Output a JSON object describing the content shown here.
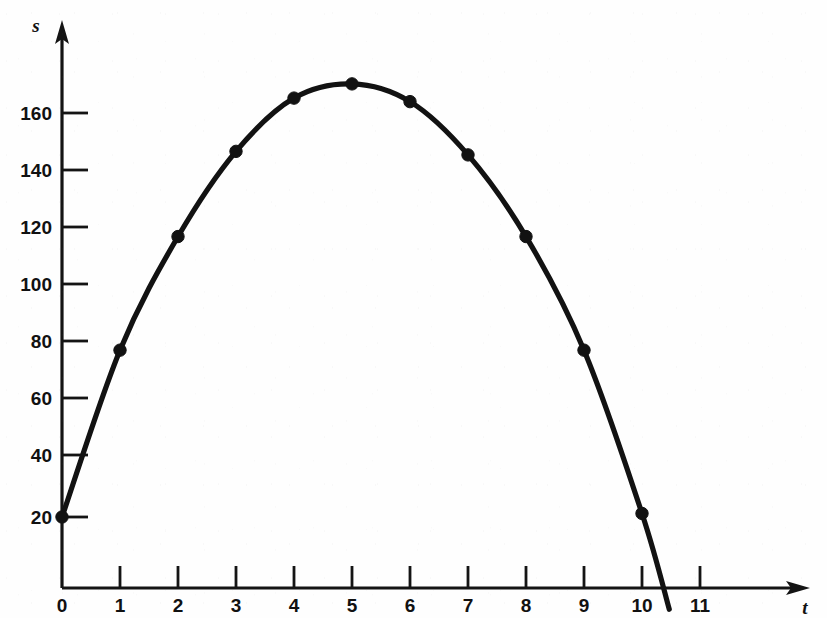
{
  "chart_data": {
    "type": "line",
    "title": "",
    "subtitle": "",
    "xlabel": "t",
    "ylabel": "s",
    "xlim": [
      0,
      11.6
    ],
    "ylim": [
      0,
      178
    ],
    "grid": false,
    "legend": null,
    "legend_position": "none",
    "x_ticks": [
      0,
      1,
      2,
      3,
      4,
      5,
      6,
      7,
      8,
      9,
      10,
      11
    ],
    "x_tick_labels": [
      "0",
      "1",
      "2",
      "3",
      "4",
      "5",
      "6",
      "7",
      "8",
      "9",
      "10",
      "11"
    ],
    "y_ticks": [
      20,
      40,
      60,
      80,
      100,
      120,
      140,
      160
    ],
    "y_tick_labels": [
      "20",
      "40",
      "60",
      "80",
      "100",
      "120",
      "140",
      "160"
    ],
    "x": [
      0,
      1,
      2,
      3,
      4,
      5,
      6,
      7,
      8,
      9,
      10
    ],
    "values": [
      20,
      67,
      99,
      123,
      138,
      142,
      137,
      122,
      99,
      67,
      21
    ],
    "markers": "filled-circle",
    "marker_color": "#121212",
    "line_color": "#121212",
    "axis_color": "#141414",
    "background_color": "#fefefe",
    "curve_extends_below_axis": true,
    "x_axis_crossing": 10.35
  },
  "axes": {
    "y_axis_name": "s",
    "x_axis_name": "t",
    "y_arrow": "arrow-up",
    "x_arrow": "arrow-right"
  },
  "colors": {
    "ink": "#121212",
    "axis": "#141414",
    "paper": "#fefefe"
  }
}
